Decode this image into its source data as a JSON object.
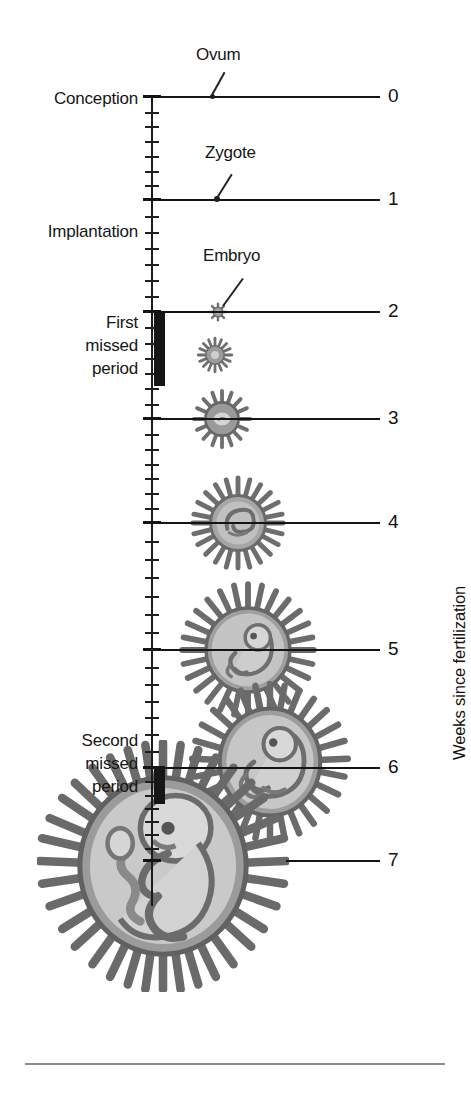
{
  "figure": {
    "axis_title": "Weeks since fertilization",
    "background_color": "#ffffff",
    "ink_color": "#161616",
    "villi_color": "#7d7d7d",
    "sac_color": "#b4b4b4"
  },
  "milestones": [
    {
      "name": "conception",
      "label": "Conception",
      "y": 99
    },
    {
      "name": "implantation",
      "label": "Implantation",
      "y": 232
    },
    {
      "name": "first-missed-period",
      "label": "First\nmissed\nperiod",
      "y": 349
    },
    {
      "name": "second-missed-period",
      "label": "Second\nmissed\nperiod",
      "y": 767
    }
  ],
  "stage_labels": [
    {
      "name": "ovum",
      "text": "Ovum",
      "x": 196,
      "y": 45
    },
    {
      "name": "zygote",
      "text": "Zygote",
      "x": 205,
      "y": 143
    },
    {
      "name": "embryo",
      "text": "Embryo",
      "x": 203,
      "y": 246
    }
  ],
  "period_bars": [
    {
      "name": "first-missed-period-bar",
      "y": 313,
      "height": 73
    },
    {
      "name": "second-missed-period-bar",
      "y": 766,
      "height": 38
    }
  ],
  "chart_data": {
    "type": "line",
    "title": "",
    "ylabel": "Weeks since fertilization",
    "xlabel": "",
    "ylim": [
      0,
      7
    ],
    "grid": false,
    "legend": "none",
    "axis_orientation": "vertical-descending",
    "tick_labels": [
      "0",
      "1",
      "2",
      "3",
      "4",
      "5",
      "6",
      "7"
    ],
    "minor_ticks_per_week": 7,
    "minor_tick_unit": "day",
    "categories": [
      "0",
      "1",
      "2",
      "3",
      "4",
      "5",
      "6",
      "7"
    ],
    "values": [
      0,
      1,
      2,
      3,
      4,
      5,
      6,
      7
    ],
    "series": [
      {
        "name": "Conceptus diameter (relative, px)",
        "values": [
          3,
          4,
          20,
          62,
          96,
          140,
          160,
          250
        ]
      }
    ],
    "annotations": [
      {
        "text": "Ovum",
        "week": 0
      },
      {
        "text": "Zygote",
        "week": 1
      },
      {
        "text": "Embryo",
        "week": 2
      },
      {
        "text": "Conception",
        "week": 0
      },
      {
        "text": "Implantation",
        "week": 1.25
      },
      {
        "text": "First missed period",
        "week": 2.1
      },
      {
        "text": "Second missed period",
        "week": 6.0
      }
    ],
    "week_rows": [
      {
        "week": "0",
        "y": 97,
        "number_x": 392,
        "rule_from": 155,
        "rule_to": 380,
        "illustration": "ovum"
      },
      {
        "week": "1",
        "y": 200,
        "number_x": 392,
        "rule_from": 155,
        "rule_to": 380,
        "illustration": "zygote"
      },
      {
        "week": "2",
        "y": 312,
        "number_x": 392,
        "rule_from": 155,
        "rule_to": 380,
        "illustration": "embryo-wk2"
      },
      {
        "week": "3",
        "y": 419,
        "number_x": 392,
        "rule_from": 155,
        "rule_to": 380,
        "illustration": "embryo-wk3"
      },
      {
        "week": "4",
        "y": 523,
        "number_x": 392,
        "rule_from": 155,
        "rule_to": 380,
        "illustration": "embryo-wk4"
      },
      {
        "week": "5",
        "y": 650,
        "number_x": 392,
        "rule_from": 155,
        "rule_to": 380,
        "illustration": "embryo-wk5"
      },
      {
        "week": "6",
        "y": 768,
        "number_x": 392,
        "rule_from": 155,
        "rule_to": 380,
        "illustration": "embryo-wk6"
      },
      {
        "week": "7",
        "y": 861,
        "number_x": 392,
        "rule_from": 286,
        "rule_to": 380,
        "illustration": "fetus-wk7"
      }
    ],
    "illustrations": [
      {
        "name": "ovum",
        "cx": 212,
        "cy": 97,
        "diameter": 4,
        "kind": "dot"
      },
      {
        "name": "zygote",
        "cx": 217,
        "cy": 200,
        "diameter": 5,
        "kind": "dot"
      },
      {
        "name": "embryo-wk2",
        "cx": 218,
        "cy": 312,
        "diameter": 22,
        "kind": "villi-ball"
      },
      {
        "name": "embryo-wk2b",
        "cx": 215,
        "cy": 355,
        "diameter": 40,
        "kind": "villi-ball"
      },
      {
        "name": "embryo-wk3",
        "cx": 222,
        "cy": 419,
        "diameter": 64,
        "kind": "villi-ball"
      },
      {
        "name": "embryo-wk4",
        "cx": 238,
        "cy": 523,
        "diameter": 98,
        "kind": "villi-embryo"
      },
      {
        "name": "embryo-wk5",
        "cx": 248,
        "cy": 650,
        "diameter": 140,
        "kind": "villi-embryo"
      },
      {
        "name": "embryo-wk6",
        "cx": 270,
        "cy": 762,
        "diameter": 162,
        "kind": "villi-embryo"
      },
      {
        "name": "fetus-wk7",
        "cx": 163,
        "cy": 866,
        "diameter": 252,
        "kind": "villi-fetus"
      }
    ]
  }
}
